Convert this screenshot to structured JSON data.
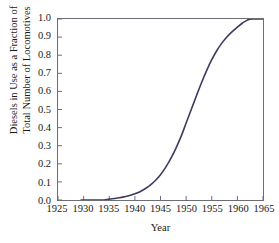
{
  "chart_data": {
    "type": "line",
    "title": "",
    "xlabel": "Year",
    "ylabel": "Diesels in Use as a Fraction of Total Number of Locomotives",
    "ylabel_lines": [
      "Diesels in Use as a Fraction of",
      "Total Number of Locomotives"
    ],
    "xlim": [
      1925,
      1965
    ],
    "ylim": [
      0.0,
      1.0
    ],
    "grid": false,
    "legend": null,
    "series_color": "#3c3c5e",
    "axis_color": "#6d6d78",
    "xticks": [
      1925,
      1930,
      1935,
      1940,
      1945,
      1950,
      1955,
      1960,
      1965
    ],
    "xtick_labels": [
      "1925",
      "1930",
      "1935",
      "1940",
      "1945",
      "1950",
      "1955",
      "1960",
      "1965"
    ],
    "yticks": [
      0.0,
      0.1,
      0.2,
      0.3,
      0.4,
      0.5,
      0.6,
      0.7,
      0.8,
      0.9,
      1.0
    ],
    "ytick_labels": [
      "0.0",
      "0.1",
      "0.2",
      "0.3",
      "0.4",
      "0.5",
      "0.6",
      "0.7",
      "0.8",
      "0.9",
      "1.0"
    ],
    "series": [
      {
        "name": "Diesel fraction",
        "x": [
          1929.5,
          1930,
          1931,
          1932,
          1933,
          1934,
          1935,
          1936,
          1937,
          1938,
          1939,
          1940,
          1941,
          1942,
          1943,
          1944,
          1945,
          1946,
          1947,
          1948,
          1949,
          1950,
          1951,
          1952,
          1953,
          1954,
          1955,
          1956,
          1957,
          1958,
          1959,
          1960,
          1961,
          1962,
          1963,
          1964,
          1965
        ],
        "values": [
          0.0,
          0.0,
          0.0,
          0.0,
          0.0,
          0.0,
          0.005,
          0.008,
          0.012,
          0.018,
          0.025,
          0.034,
          0.046,
          0.062,
          0.082,
          0.108,
          0.14,
          0.18,
          0.228,
          0.285,
          0.35,
          0.425,
          0.5,
          0.575,
          0.648,
          0.715,
          0.775,
          0.826,
          0.868,
          0.902,
          0.93,
          0.955,
          0.978,
          0.995,
          1.0,
          1.0,
          1.0
        ]
      }
    ]
  }
}
